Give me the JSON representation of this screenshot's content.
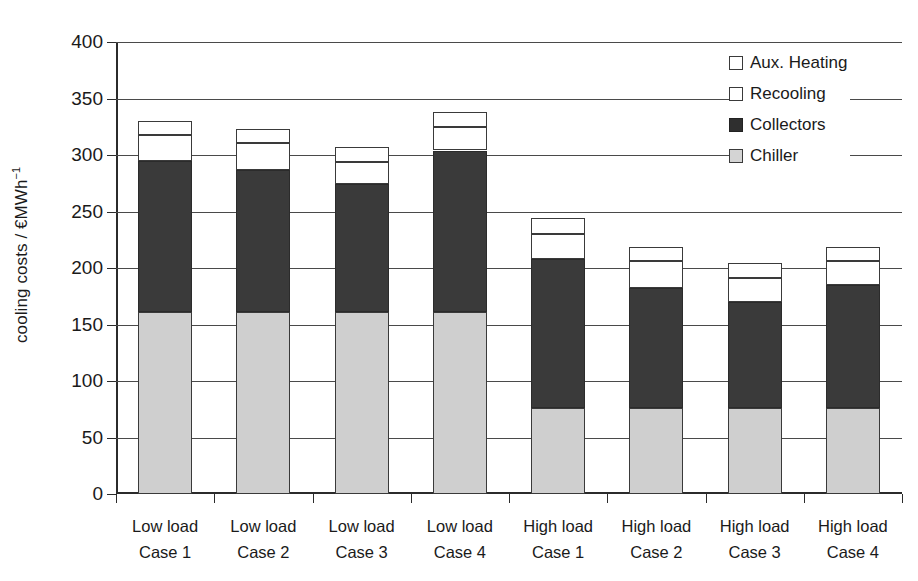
{
  "chart_data": {
    "type": "bar",
    "subtype": "stacked",
    "title": "",
    "xlabel": "",
    "ylabel": "cooling costs / €MWh⁻¹",
    "ylim": [
      0,
      400
    ],
    "yticks": [
      0,
      50,
      100,
      150,
      200,
      250,
      300,
      350,
      400
    ],
    "ytick_labels": [
      "0",
      "50",
      "100",
      "150",
      "200",
      "250",
      "300",
      "350",
      "400"
    ],
    "grid": true,
    "grid_axis": "y",
    "legend_position": "top-right",
    "categories": [
      "Low load\nCase 1",
      "Low load\nCase 2",
      "Low load\nCase 3",
      "Low load\nCase 4",
      "High load\nCase 1",
      "High load\nCase 2",
      "High load\nCase 3",
      "High load\nCase 4"
    ],
    "category_lines": [
      [
        "Low load",
        "Case 1"
      ],
      [
        "Low load",
        "Case 2"
      ],
      [
        "Low load",
        "Case 3"
      ],
      [
        "Low load",
        "Case 4"
      ],
      [
        "High load",
        "Case 1"
      ],
      [
        "High load",
        "Case 2"
      ],
      [
        "High load",
        "Case 3"
      ],
      [
        "High load",
        "Case 4"
      ]
    ],
    "series": [
      {
        "name": "Chiller",
        "color": "#cfcfcf",
        "values": [
          161,
          161,
          161,
          161,
          76,
          76,
          76,
          76
        ]
      },
      {
        "name": "Collectors",
        "color": "#3a3a3a",
        "values": [
          134,
          126,
          113,
          143,
          132,
          106,
          94,
          109
        ]
      },
      {
        "name": "Recooling",
        "color": "#ffffff",
        "values": [
          23,
          24,
          20,
          21,
          22,
          24,
          21,
          21
        ]
      },
      {
        "name": "Aux. Heating",
        "color": "#ffffff",
        "values": [
          12,
          12,
          13,
          13,
          14,
          13,
          13,
          13
        ]
      }
    ],
    "totals": [
      330,
      323,
      307,
      338,
      244,
      219,
      204,
      219
    ],
    "stack_order_bottom_to_top": [
      "Chiller",
      "Collectors",
      "Recooling",
      "Aux. Heating"
    ]
  },
  "legend": {
    "items": [
      {
        "label": "Aux. Heating",
        "swatch": "aux"
      },
      {
        "label": "Recooling",
        "swatch": "recooling"
      },
      {
        "label": "Collectors",
        "swatch": "collectors"
      },
      {
        "label": "Chiller",
        "swatch": "chiller"
      }
    ]
  },
  "axis": {
    "y_title_main": "cooling costs / €MWh",
    "y_title_exponent": "−1"
  }
}
